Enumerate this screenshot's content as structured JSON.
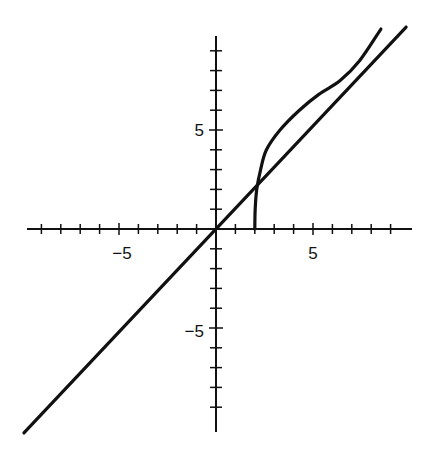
{
  "chart_data": {
    "type": "line",
    "title": "",
    "xlabel": "",
    "ylabel": "",
    "xlim": [
      -10,
      10
    ],
    "ylim": [
      -10.3,
      9.8
    ],
    "grid": false,
    "legend": null,
    "x_tick_labels": [
      {
        "value": -5,
        "label": "−5"
      },
      {
        "value": 5,
        "label": "5"
      }
    ],
    "y_tick_labels": [
      {
        "value": 5,
        "label": "5"
      },
      {
        "value": -5,
        "label": "−5"
      }
    ],
    "x_minor_ticks": [
      -9,
      -8,
      -7,
      -6,
      -5,
      -4,
      -3,
      -2,
      -1,
      1,
      2,
      3,
      4,
      5,
      6,
      7,
      8,
      9
    ],
    "y_minor_ticks": [
      -9,
      -8,
      -7,
      -6,
      -5,
      -4,
      -3,
      -2,
      -1,
      1,
      2,
      3,
      4,
      5,
      6,
      7,
      8,
      9
    ],
    "series": [
      {
        "name": "line y = x",
        "points": [
          [
            -9.9,
            -10.3
          ],
          [
            9.8,
            10.2
          ]
        ]
      },
      {
        "name": "curve",
        "points": [
          [
            2.0,
            0.0
          ],
          [
            2.02,
            1.0
          ],
          [
            2.1,
            2.0
          ],
          [
            2.3,
            3.0
          ],
          [
            2.6,
            4.0
          ],
          [
            3.3,
            5.0
          ],
          [
            4.3,
            6.0
          ],
          [
            5.3,
            6.8
          ],
          [
            6.4,
            7.5
          ],
          [
            7.4,
            8.5
          ],
          [
            8.5,
            10.1
          ]
        ]
      }
    ]
  },
  "labels": {
    "x_neg5": "−5",
    "x_pos5": "5",
    "y_pos5": "5",
    "y_neg5": "−5"
  }
}
